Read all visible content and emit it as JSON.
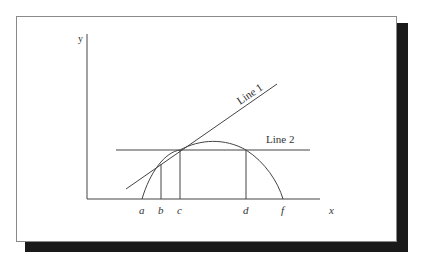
{
  "diagram": {
    "axes": {
      "x_label": "x",
      "y_label": "y"
    },
    "lines": [
      {
        "label": "Line 1",
        "description": "tangent line to curve at point c"
      },
      {
        "label": "Line 2",
        "description": "horizontal line intersecting curve at c and d"
      }
    ],
    "points": [
      "a",
      "b",
      "c",
      "d",
      "f"
    ],
    "colors": {
      "stroke": "#444444",
      "shadow": "#1a1a1a",
      "background": "#ffffff"
    }
  }
}
